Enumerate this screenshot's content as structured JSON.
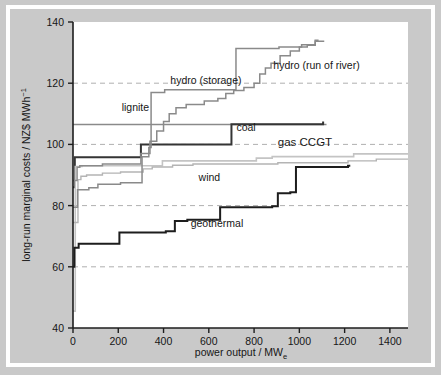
{
  "figure": {
    "background_color": "#c9c9c9",
    "plot_background_color": "#ffffff",
    "border_color": "#ffffff"
  },
  "chart_data": {
    "type": "line",
    "title": "",
    "subtitle": "",
    "xlabel": "power output / MW",
    "xlabel_sub": "e",
    "ylabel": "long-run marginal costs / NZ$ MWh",
    "ylabel_sup": "−1",
    "xlim": [
      0,
      1480
    ],
    "ylim": [
      40,
      140
    ],
    "xticks": [
      0,
      200,
      400,
      600,
      800,
      1000,
      1200,
      1400
    ],
    "xtick_labels": [
      "0",
      "200",
      "400",
      "600",
      "800",
      "1000",
      "1200",
      "1400"
    ],
    "yticks": [
      40,
      60,
      80,
      100,
      120,
      140
    ],
    "ytick_labels": [
      "40",
      "60",
      "80",
      "100",
      "120",
      "140"
    ],
    "grid": "horizontal dashed at 60, 80, 100, 120",
    "gridlines_y": [
      60,
      80,
      100,
      120
    ],
    "legend": "inline labels next to curves",
    "step_type": "post",
    "series": [
      {
        "name": "lignite",
        "color": "#8a8a8a",
        "width": 1.4,
        "label_x": 215,
        "label_y": 111,
        "points": [
          [
            0,
            106.5
          ],
          [
            1120,
            106.5
          ]
        ]
      },
      {
        "name": "coal",
        "color": "#353535",
        "width": 2.0,
        "label_x": 722,
        "label_y": 104.5,
        "points": [
          [
            0,
            86
          ],
          [
            8,
            95.8
          ],
          [
            290,
            95.8
          ],
          [
            300,
            100
          ],
          [
            690,
            100
          ],
          [
            700,
            106.6
          ],
          [
            1105,
            106.6
          ],
          [
            1105,
            107.5
          ]
        ]
      },
      {
        "name": "gas CCGT",
        "color": "#c4c4c4",
        "width": 1.6,
        "label_x": 905,
        "label_y": 99.5,
        "points": [
          [
            0,
            45.5
          ],
          [
            10,
            92.8
          ],
          [
            30,
            92.8
          ],
          [
            40,
            93.0
          ],
          [
            380,
            93.0
          ],
          [
            395,
            94.6
          ],
          [
            800,
            94.6
          ],
          [
            810,
            95.5
          ],
          [
            870,
            95.5
          ],
          [
            880,
            96.0
          ],
          [
            1230,
            96.0
          ],
          [
            1240,
            96.9
          ],
          [
            1480,
            96.9
          ]
        ]
      },
      {
        "name": "wind",
        "color": "#b4b4b4",
        "width": 1.4,
        "label_x": 555,
        "label_y": 88.0,
        "points": [
          [
            0,
            74.5
          ],
          [
            18,
            74.5
          ],
          [
            22,
            88.5
          ],
          [
            30,
            88.5
          ],
          [
            35,
            89.6
          ],
          [
            55,
            89.6
          ],
          [
            60,
            90.0
          ],
          [
            120,
            90.0
          ],
          [
            130,
            90.6
          ],
          [
            200,
            90.6
          ],
          [
            210,
            91.0
          ],
          [
            300,
            91.0
          ],
          [
            310,
            92.0
          ],
          [
            345,
            92.0
          ],
          [
            350,
            92.6
          ],
          [
            430,
            92.6
          ],
          [
            440,
            93.2
          ],
          [
            520,
            93.2
          ],
          [
            530,
            93.6
          ],
          [
            900,
            93.6
          ],
          [
            905,
            94.0
          ],
          [
            1210,
            94.0
          ],
          [
            1215,
            94.6
          ],
          [
            1330,
            94.6
          ],
          [
            1340,
            95.2
          ],
          [
            1480,
            95.2
          ]
        ]
      },
      {
        "name": "hydro (storage)",
        "color": "#8a8a8a",
        "width": 1.5,
        "label_x": 430,
        "label_y": 119.6,
        "points": [
          [
            0,
            79.5
          ],
          [
            10,
            79.5
          ],
          [
            20,
            85.2
          ],
          [
            60,
            85.2
          ],
          [
            70,
            85.8
          ],
          [
            100,
            85.8
          ],
          [
            110,
            87.0
          ],
          [
            200,
            87.0
          ],
          [
            210,
            87.5
          ],
          [
            300,
            87.5
          ],
          [
            305,
            96.0
          ],
          [
            330,
            96.0
          ],
          [
            335,
            99.0
          ],
          [
            340,
            99.0
          ],
          [
            345,
            117.0
          ],
          [
            400,
            117.0
          ],
          [
            405,
            117.9
          ],
          [
            710,
            117.9
          ],
          [
            720,
            131.3
          ],
          [
            900,
            131.3
          ],
          [
            910,
            131.8
          ],
          [
            1000,
            131.8
          ],
          [
            1010,
            132.6
          ],
          [
            1060,
            132.6
          ],
          [
            1070,
            133.7
          ],
          [
            1110,
            133.7
          ]
        ]
      },
      {
        "name": "hydro (run of river)",
        "color": "#8a8a8a",
        "width": 1.5,
        "label_x": 885,
        "label_y": 124.5,
        "points": [
          [
            0,
            88.2
          ],
          [
            12,
            88.2
          ],
          [
            18,
            92.5
          ],
          [
            25,
            92.5
          ],
          [
            30,
            93.0
          ],
          [
            120,
            93.0
          ],
          [
            130,
            93.6
          ],
          [
            290,
            93.6
          ],
          [
            300,
            97.0
          ],
          [
            330,
            97.0
          ],
          [
            340,
            101.0
          ],
          [
            365,
            101.0
          ],
          [
            370,
            104.4
          ],
          [
            395,
            104.4
          ],
          [
            400,
            107.5
          ],
          [
            420,
            107.5
          ],
          [
            425,
            110.0
          ],
          [
            450,
            110.0
          ],
          [
            455,
            112.0
          ],
          [
            490,
            112.0
          ],
          [
            500,
            113.0
          ],
          [
            570,
            113.0
          ],
          [
            580,
            114.2
          ],
          [
            630,
            114.2
          ],
          [
            640,
            115.0
          ],
          [
            670,
            115.0
          ],
          [
            675,
            116.6
          ],
          [
            700,
            116.6
          ],
          [
            710,
            117.6
          ],
          [
            745,
            117.6
          ],
          [
            755,
            118.6
          ],
          [
            790,
            118.6
          ],
          [
            800,
            120.0
          ],
          [
            820,
            120.0
          ],
          [
            825,
            123.0
          ],
          [
            845,
            123.0
          ],
          [
            850,
            125.0
          ],
          [
            870,
            125.0
          ],
          [
            875,
            126.5
          ],
          [
            905,
            126.5
          ],
          [
            915,
            129.0
          ],
          [
            950,
            129.0
          ],
          [
            960,
            130.5
          ],
          [
            990,
            130.5
          ],
          [
            1000,
            131.8
          ],
          [
            1025,
            131.8
          ],
          [
            1035,
            132.4
          ],
          [
            1060,
            132.4
          ],
          [
            1070,
            134.0
          ],
          [
            1085,
            134.0
          ]
        ]
      },
      {
        "name": "geothermal",
        "color": "#1d1d1d",
        "width": 2.0,
        "label_x": 520,
        "label_y": 73.0,
        "points": [
          [
            0,
            60
          ],
          [
            6,
            66.2
          ],
          [
            20,
            66.2
          ],
          [
            25,
            67.5
          ],
          [
            195,
            67.5
          ],
          [
            205,
            71.2
          ],
          [
            400,
            71.2
          ],
          [
            410,
            71.6
          ],
          [
            440,
            71.6
          ],
          [
            450,
            75.0
          ],
          [
            500,
            75.0
          ],
          [
            505,
            75.4
          ],
          [
            640,
            75.4
          ],
          [
            650,
            79.5
          ],
          [
            870,
            79.5
          ],
          [
            880,
            79.8
          ],
          [
            895,
            79.8
          ],
          [
            905,
            84.0
          ],
          [
            950,
            84.0
          ],
          [
            960,
            84.4
          ],
          [
            975,
            84.4
          ],
          [
            985,
            92.6
          ],
          [
            1210,
            92.6
          ],
          [
            1215,
            93.0
          ],
          [
            1225,
            93.0
          ]
        ]
      }
    ],
    "series_labels": [
      {
        "name": "lignite",
        "text": "lignite"
      },
      {
        "name": "coal",
        "text": "coal"
      },
      {
        "name": "gas-ccgt",
        "text": "gas CCGT"
      },
      {
        "name": "wind",
        "text": "wind"
      },
      {
        "name": "hydro-storage",
        "text": "hydro (storage)"
      },
      {
        "name": "hydro-run-of-river",
        "text": "hydro (run of river)"
      },
      {
        "name": "geothermal",
        "text": "geothermal"
      }
    ]
  }
}
